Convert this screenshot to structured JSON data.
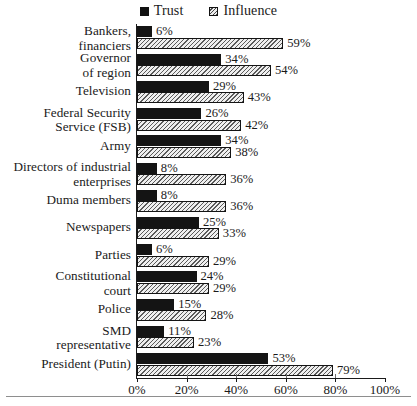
{
  "legend": {
    "position": "top-center",
    "entries": [
      {
        "label": "Trust",
        "swatch": "solid-black-square-icon",
        "color": "#141414"
      },
      {
        "label": "Influence",
        "swatch": "hatched-square-icon",
        "color": "#dadada"
      }
    ]
  },
  "axis": {
    "x_ticks": [
      "0%",
      "20%",
      "40%",
      "60%",
      "80%",
      "100%"
    ],
    "x_tick_values": [
      0,
      20,
      40,
      60,
      80,
      100
    ],
    "xlim": [
      0,
      100
    ]
  },
  "chart_data": {
    "type": "bar",
    "orientation": "horizontal",
    "title": "",
    "subtitle": "",
    "xlabel": "",
    "ylabel": "",
    "xlim": [
      0,
      100
    ],
    "grid": false,
    "legend_position": "top-center",
    "value_suffix": "%",
    "categories": [
      "Bankers, financiers",
      "Governor of region",
      "Television",
      "Federal Security Service (FSB)",
      "Army",
      "Directors of industrial enterprises",
      "Duma members",
      "Newspapers",
      "Parties",
      "Constitutional court",
      "Police",
      "SMD representative",
      "President (Putin)"
    ],
    "category_lines": [
      [
        "Bankers,",
        "financiers"
      ],
      [
        "Governor",
        "of region"
      ],
      [
        "Television"
      ],
      [
        "Federal Security",
        "Service (FSB)"
      ],
      [
        "Army"
      ],
      [
        "Directors of industrial",
        "enterprises"
      ],
      [
        "Duma members"
      ],
      [
        "Newspapers"
      ],
      [
        "Parties"
      ],
      [
        "Constitutional",
        "court"
      ],
      [
        "Police"
      ],
      [
        "SMD",
        "representative"
      ],
      [
        "President (Putin)"
      ]
    ],
    "series": [
      {
        "name": "Trust",
        "values": [
          6,
          34,
          29,
          26,
          34,
          8,
          8,
          25,
          6,
          24,
          15,
          11,
          53
        ],
        "labels": [
          "6%",
          "34%",
          "29%",
          "26%",
          "34%",
          "8%",
          "8%",
          "25%",
          "6%",
          "24%",
          "15%",
          "11%",
          "53%"
        ]
      },
      {
        "name": "Influence",
        "values": [
          59,
          54,
          43,
          42,
          38,
          36,
          36,
          33,
          29,
          29,
          28,
          23,
          79
        ],
        "labels": [
          "59%",
          "54%",
          "43%",
          "42%",
          "38%",
          "36%",
          "36%",
          "33%",
          "29%",
          "29%",
          "28%",
          "23%",
          "79%"
        ]
      }
    ]
  }
}
